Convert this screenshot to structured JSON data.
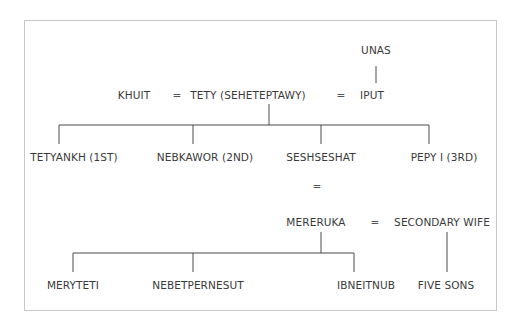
{
  "diagram": {
    "type": "family-tree",
    "generation_1": {
      "parent_of_iput": "UNAS",
      "spouse_left": "KHUIT",
      "king": "TETY (SEHETEPTAWY)",
      "spouse_right": "IPUT",
      "marriage_symbol": "="
    },
    "generation_2": {
      "children": [
        "TETYANKH (1ST)",
        "NEBKAWOR (2ND)",
        "SESHSESHAT",
        "PEPY I (3RD)"
      ]
    },
    "marriage_2": {
      "symbol_vertical": "=",
      "husband": "MERERUKA",
      "symbol": "=",
      "secondary_wife": "SECONDARY WIFE"
    },
    "generation_3": {
      "children_with_seshseshat": [
        "MERYTETI",
        "NEBETPERNESUT",
        "IBNEITNUB"
      ],
      "children_with_secondary_wife": "FIVE SONS"
    }
  }
}
